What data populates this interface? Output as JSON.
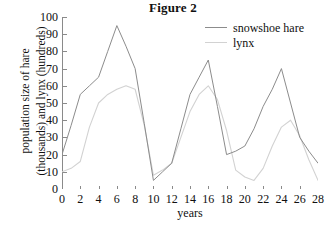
{
  "figure": {
    "title": "Figure 2"
  },
  "chart_data": {
    "type": "line",
    "title": "Figure 2",
    "xlabel": "years",
    "ylabel": "population size of hare (thousands) and lynx (hundreds)",
    "ylabel_lines": [
      "population size of hare",
      "(thousands) and lynx (hundreds)"
    ],
    "xlim": [
      0,
      28
    ],
    "ylim": [
      0,
      100
    ],
    "x_ticks": [
      0,
      2,
      4,
      6,
      8,
      10,
      12,
      14,
      16,
      18,
      20,
      22,
      24,
      26,
      28
    ],
    "y_ticks": [
      0,
      10,
      20,
      30,
      40,
      50,
      60,
      70,
      80,
      90,
      100
    ],
    "grid": false,
    "legend_position": "top-right",
    "x": [
      0,
      1,
      2,
      3,
      4,
      5,
      6,
      7,
      8,
      9,
      10,
      11,
      12,
      13,
      14,
      15,
      16,
      17,
      18,
      19,
      20,
      21,
      22,
      23,
      24,
      25,
      26,
      27,
      28
    ],
    "series": [
      {
        "name": "snowshoe hare",
        "color": "#8c8c8c",
        "values": [
          20,
          37,
          55,
          60,
          65,
          80,
          95,
          83,
          70,
          38,
          5,
          10,
          15,
          35,
          55,
          65,
          75,
          48,
          20,
          22,
          25,
          35,
          48,
          58,
          70,
          50,
          30,
          22,
          15
        ]
      },
      {
        "name": "lynx",
        "color": "#d2d2d2",
        "values": [
          10,
          12,
          16,
          36,
          50,
          55,
          58,
          60,
          58,
          37,
          8,
          11,
          15,
          30,
          45,
          55,
          60,
          52,
          34,
          11,
          7,
          5,
          12,
          25,
          36,
          40,
          31,
          17,
          5
        ]
      }
    ]
  },
  "legend": {
    "entries": [
      {
        "label": "snowshoe hare"
      },
      {
        "label": "lynx"
      }
    ]
  },
  "axes": {
    "y_tick_labels": [
      "100",
      "90",
      "80",
      "70",
      "60",
      "50",
      "40",
      "30",
      "20",
      "10",
      "0"
    ],
    "x_tick_labels": [
      "0",
      "2",
      "4",
      "6",
      "8",
      "10",
      "12",
      "14",
      "16",
      "18",
      "20",
      "22",
      "24",
      "26",
      "28"
    ]
  },
  "colors": {
    "hare": "#8c8c8c",
    "lynx": "#d2d2d2",
    "axis": "#8a8a8a",
    "text": "#101010",
    "background": "#ffffff"
  }
}
